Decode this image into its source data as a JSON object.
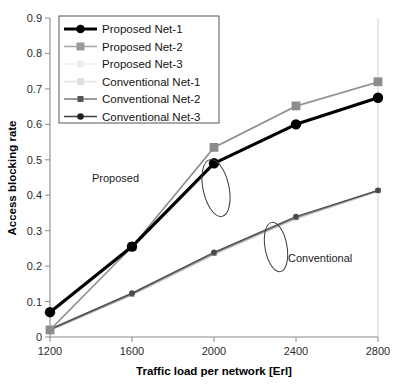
{
  "chart_data": {
    "type": "line",
    "title": "",
    "xlabel": "Traffic load per network [Erl]",
    "ylabel": "Access blocking rate",
    "x": [
      1200,
      1600,
      2000,
      2400,
      2800
    ],
    "xticklabels": [
      "1200",
      "1600",
      "2000",
      "2400",
      "2800"
    ],
    "yticklabels": [
      "0",
      "0.1",
      "0.2",
      "0.3",
      "0.4",
      "0.5",
      "0.6",
      "0.7",
      "0.8",
      "0.9"
    ],
    "xlim": [
      1200,
      2800
    ],
    "ylim": [
      0,
      0.9
    ],
    "grid": "horizontal",
    "legend_position": "top-left",
    "series": [
      {
        "name": "Proposed Net-1",
        "values": [
          0.07,
          0.255,
          0.49,
          0.6,
          0.675
        ],
        "color": "#000000",
        "marker": "circle",
        "width": 3.2
      },
      {
        "name": "Proposed Net-2",
        "values": [
          0.02,
          0.255,
          0.535,
          0.652,
          0.72
        ],
        "color": "#8c8c8c",
        "marker": "square",
        "width": 1.4
      },
      {
        "name": "Proposed Net-3",
        "values": [
          0.02,
          0.253,
          0.533,
          0.65,
          0.718
        ],
        "color": "#bdbdbd",
        "marker": "none",
        "width": 1.2
      },
      {
        "name": "Conventional Net-1",
        "values": [
          0.018,
          0.118,
          0.232,
          0.333,
          0.41
        ],
        "color": "#d0d0d0",
        "marker": "none",
        "width": 1.2
      },
      {
        "name": "Conventional Net-2",
        "values": [
          0.02,
          0.121,
          0.236,
          0.337,
          0.413
        ],
        "color": "#7a7a7a",
        "marker": "square-small",
        "width": 1.3
      },
      {
        "name": "Conventional Net-3",
        "values": [
          0.022,
          0.124,
          0.239,
          0.34,
          0.414
        ],
        "color": "#4a4a4a",
        "marker": "circle-small",
        "width": 1.3
      }
    ],
    "annotations": [
      {
        "text": "Proposed",
        "x": 78,
        "y": 178
      },
      {
        "text": "Conventional",
        "x": 287,
        "y": 258
      }
    ],
    "ellipses": [
      {
        "cx": 216,
        "cy": 188,
        "rx": 13,
        "ry": 28,
        "rot": -12
      },
      {
        "cx": 276,
        "cy": 247,
        "rx": 11,
        "ry": 24,
        "rot": -10
      }
    ]
  },
  "legend": {
    "entries": [
      {
        "label": "Proposed Net-1"
      },
      {
        "label": "Proposed Net-2"
      },
      {
        "label": "Proposed Net-3"
      },
      {
        "label": "Conventional Net-1"
      },
      {
        "label": "Conventional Net-2"
      },
      {
        "label": "Conventional Net-3"
      }
    ]
  },
  "axes": {
    "y_title": "Access blocking rate",
    "x_title": "Traffic load per network [Erl]",
    "yticks": [
      "0.9",
      "0.8",
      "0.7",
      "0.6",
      "0.5",
      "0.4",
      "0.3",
      "0.2",
      "0.1",
      "0"
    ],
    "xticks": [
      "1200",
      "1600",
      "2000",
      "2400",
      "2800"
    ]
  }
}
